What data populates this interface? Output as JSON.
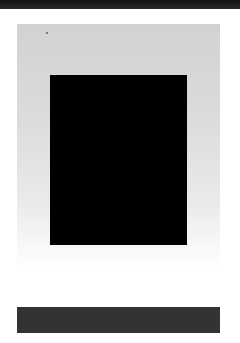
{
  "document": {
    "header_bar": {
      "color": "#1a1a1a"
    },
    "panel": {
      "gradient_top": "#d2d2d2",
      "gradient_bottom": "#ffffff"
    },
    "figure": {
      "fill": "#000000",
      "caption": ""
    },
    "footer_bar": {
      "color": "#333333"
    }
  }
}
